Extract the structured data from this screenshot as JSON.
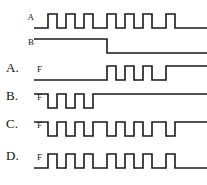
{
  "figure": {
    "stroke_color": "#1a1a1a",
    "background_color": "#ffffff",
    "time_span": 173,
    "high_y": 6,
    "low_y": 20
  },
  "given": {
    "rows": [
      {
        "option": "",
        "signal": "A",
        "name": "signal-a",
        "description": "Clock-like pulse train, six high pulses",
        "start_level": 0,
        "transitions": [
          14,
          23,
          32,
          41,
          50,
          59,
          73,
          82,
          91,
          100,
          109,
          118,
          132,
          141
        ]
      },
      {
        "option": "",
        "signal": "B",
        "name": "signal-b",
        "description": "High for first half, falls low at mid-point",
        "start_level": 1,
        "transitions": [
          73
        ]
      }
    ]
  },
  "options": {
    "rows": [
      {
        "option": "A.",
        "signal": "F",
        "name": "option-a",
        "description": "Low during first half, pulse train during second half",
        "start_level": 0,
        "transitions": [
          73,
          82,
          91,
          100,
          109,
          118,
          132
        ]
      },
      {
        "option": "B.",
        "signal": "F",
        "name": "option-b",
        "description": "High with two low dips in first half, then high",
        "start_level": 1,
        "transitions": [
          14,
          23,
          32,
          41,
          50,
          59
        ]
      },
      {
        "option": "C.",
        "signal": "F",
        "name": "option-c",
        "description": "Inverted pulse train across the full span",
        "start_level": 1,
        "transitions": [
          14,
          23,
          32,
          41,
          50,
          59,
          73,
          82,
          91,
          100,
          109,
          118,
          132,
          141
        ]
      },
      {
        "option": "D.",
        "signal": "F",
        "name": "option-d",
        "description": "Pulse train identical to input A across full span",
        "start_level": 0,
        "transitions": [
          14,
          23,
          32,
          41,
          50,
          59,
          73,
          82,
          91,
          100,
          109,
          118,
          132,
          141
        ]
      }
    ]
  },
  "layout": {
    "row_tops": [
      8,
      33,
      60,
      88,
      116,
      148
    ],
    "signal_label_left": [
      22,
      22,
      30,
      30,
      30,
      30
    ],
    "option_label_left": 6
  }
}
